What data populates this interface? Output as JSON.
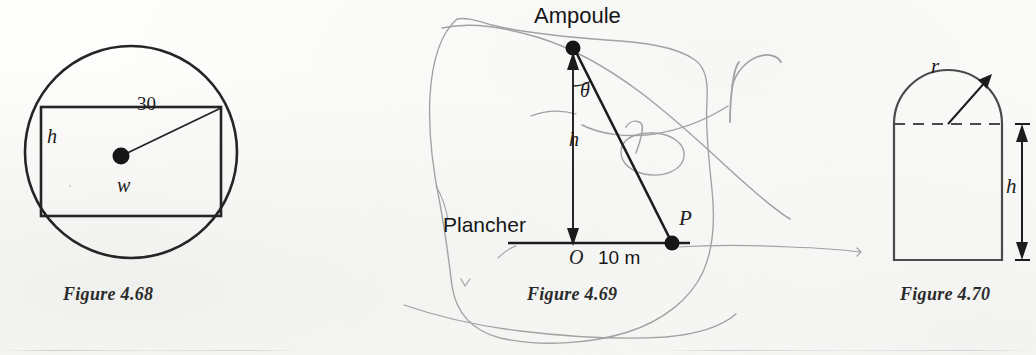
{
  "page": {
    "width": 1036,
    "height": 355,
    "background": "#fdfdfc",
    "ink_color": "#1c1c1c",
    "pencil_color": "#8e8e8e"
  },
  "figures": [
    {
      "id": "figure-4-68",
      "caption": "Figure 4.68",
      "caption_x": 63,
      "caption_y": 289,
      "description": "Rectangle inscribed in a circle, radius drawn from centre to upper-right corner",
      "labels": [
        {
          "name": "radius-value-label",
          "text": "30",
          "x": 137,
          "y": 103,
          "style": "num",
          "size": 19
        },
        {
          "name": "height-label",
          "text": "h",
          "x": 47,
          "y": 134,
          "style": "math",
          "size": 19
        },
        {
          "name": "width-label",
          "text": "w",
          "x": 117,
          "y": 183,
          "style": "math",
          "size": 19
        }
      ],
      "geometry": {
        "circle": {
          "cx": 131,
          "cy": 152,
          "r": 106
        },
        "rectangle": {
          "x": 41,
          "y": 107,
          "w": 180,
          "h": 109
        },
        "centre_dot": {
          "cx": 121,
          "cy": 156,
          "r": 8
        },
        "radius_line": {
          "x1": 121,
          "y1": 156,
          "x2": 221,
          "y2": 108
        }
      }
    },
    {
      "id": "figure-4-69",
      "caption": "Figure 4.69",
      "caption_x": 527,
      "caption_y": 289,
      "description": "Light bulb above a floor, angle theta at the bulb, height h, point P ten metres from O",
      "labels": [
        {
          "name": "bulb-label",
          "text": "Ampoule",
          "x": 534,
          "y": 5,
          "style": "plain",
          "size": 21
        },
        {
          "name": "angle-theta-label",
          "text": "θ",
          "x": 580,
          "y": 87,
          "style": "math",
          "size": 19
        },
        {
          "name": "height-label",
          "text": "h",
          "x": 570,
          "y": 136,
          "style": "math",
          "size": 19
        },
        {
          "name": "floor-label",
          "text": "Plancher",
          "x": 443,
          "y": 216,
          "style": "plain",
          "size": 21
        },
        {
          "name": "point-p-label",
          "text": "P",
          "x": 678,
          "y": 213,
          "style": "math",
          "size": 19
        },
        {
          "name": "origin-label",
          "text": "O",
          "x": 570,
          "y": 249,
          "style": "math",
          "size": 19
        },
        {
          "name": "distance-label",
          "text": "10 m",
          "x": 597,
          "y": 250,
          "style": "plain",
          "size": 18
        }
      ],
      "geometry": {
        "bulb_dot": {
          "cx": 573,
          "cy": 48,
          "r": 7
        },
        "p_dot": {
          "cx": 672,
          "cy": 243,
          "r": 7
        },
        "vertical_arrow": {
          "x1": 573,
          "y1": 243,
          "x2": 573,
          "y2": 58
        },
        "hypotenuse": {
          "x1": 576,
          "y1": 53,
          "x2": 670,
          "y2": 241
        },
        "floor_line": {
          "x1": 508,
          "y1": 243,
          "x2": 690,
          "y2": 243
        }
      },
      "annotations": [
        {
          "name": "handwritten-r-label",
          "text": "r",
          "x": 723,
          "y": 75
        },
        {
          "name": "handwritten-r-circled-label",
          "text": "r",
          "x": 632,
          "y": 133
        }
      ]
    },
    {
      "id": "figure-4-70",
      "caption": "Figure 4.70",
      "caption_x": 900,
      "caption_y": 289,
      "description": "Norman window: semicircle of radius r on top of a rectangle of height h",
      "labels": [
        {
          "name": "radius-label",
          "text": "r",
          "x": 931,
          "y": 62,
          "style": "math",
          "size": 19
        },
        {
          "name": "height-label",
          "text": "h",
          "x": 1014,
          "y": 183,
          "style": "math",
          "size": 19
        }
      ],
      "geometry": {
        "rect": {
          "x": 894,
          "y": 124,
          "w": 108,
          "h": 136
        },
        "arc_radius": 54,
        "dashed_line": {
          "x1": 894,
          "y1": 124,
          "x2": 1002,
          "y2": 124
        },
        "radius_arrow": {
          "x1": 948,
          "y1": 124,
          "x2": 991,
          "y2": 76
        },
        "dimension_line": {
          "x": 1007,
          "y1": 126,
          "y2": 258
        }
      }
    }
  ]
}
